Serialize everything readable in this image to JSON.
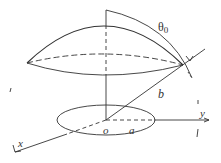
{
  "diagram": {
    "labels": {
      "theta": "θ",
      "theta_sub": "0",
      "b": "b",
      "o": "o",
      "a": "a",
      "x": "x",
      "y": "y"
    },
    "colors": {
      "stroke": "#333333",
      "background": "#ffffff"
    }
  }
}
